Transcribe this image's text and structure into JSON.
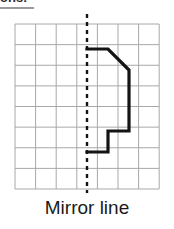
{
  "header": {
    "fragment_text": "ons:",
    "visible": true
  },
  "caption": {
    "text": "Mirror line"
  },
  "colors": {
    "grid_line": "#a8a8a8",
    "shape_stroke": "#141414",
    "mirror_line": "#141414",
    "background": "#ffffff",
    "caption_text": "#1a1a1a"
  },
  "figure": {
    "grid": {
      "x": 15,
      "y": 14,
      "cell": 20.6,
      "cols": 7,
      "rows": 8,
      "width": 144,
      "height": 165,
      "stroke_width": 1
    },
    "mirror_line": {
      "label": "Mirror line",
      "x": 87,
      "y_top": 4,
      "y_bottom": 183,
      "dash": "4 4",
      "stroke_width": 2.4
    },
    "shape": {
      "name": "half-figure-right-of-mirror",
      "stroke_width": 3.2,
      "points": [
        [
          87,
          39
        ],
        [
          108,
          39
        ],
        [
          129,
          60
        ],
        [
          129,
          121
        ],
        [
          108,
          121
        ],
        [
          108,
          142
        ],
        [
          87,
          142
        ]
      ]
    }
  }
}
